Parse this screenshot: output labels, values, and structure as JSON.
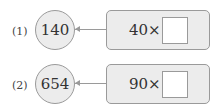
{
  "problems": [
    {
      "label": "(1)",
      "result": "140",
      "expression": "40×"
    },
    {
      "label": "(2)",
      "result": "654",
      "expression": "90×"
    }
  ]
}
